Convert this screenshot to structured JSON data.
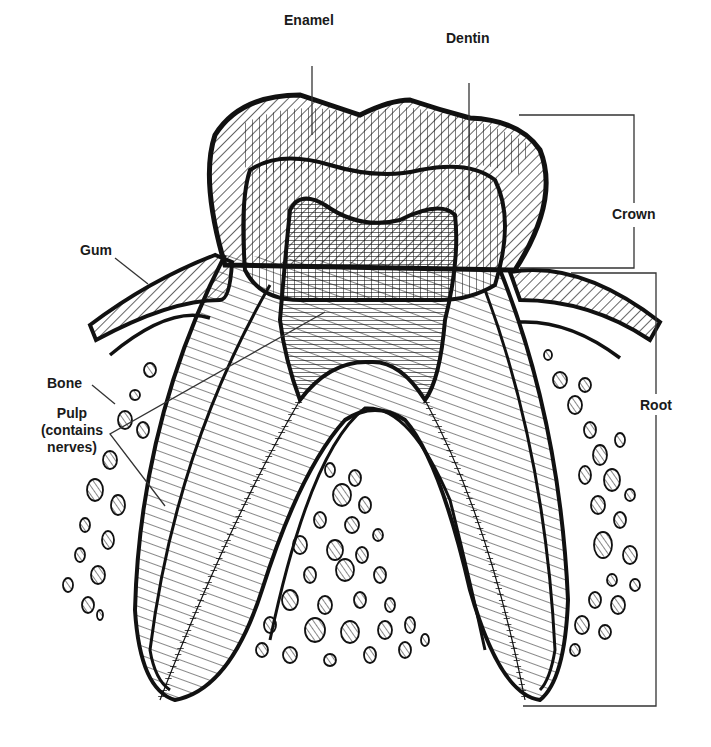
{
  "diagram": {
    "labels": {
      "enamel": "Enamel",
      "dentin": "Dentin",
      "crown": "Crown",
      "gum": "Gum",
      "bone": "Bone",
      "pulp_line1": "Pulp",
      "pulp_line2": "(contains",
      "pulp_line3": "nerves)",
      "root": "Root"
    },
    "colors": {
      "ink": "#111111",
      "background": "#ffffff"
    }
  }
}
